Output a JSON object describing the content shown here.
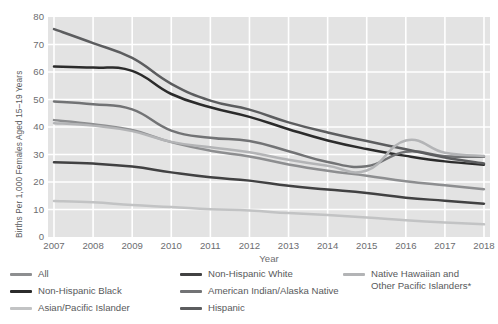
{
  "chart_data": {
    "type": "line",
    "title": "",
    "xlabel": "Year",
    "ylabel": "Births Per 1,000 Females Aged 15–19 Years",
    "x": [
      2007,
      2008,
      2009,
      2010,
      2011,
      2012,
      2013,
      2014,
      2015,
      2016,
      2017,
      2018
    ],
    "xticklabels": [
      "2007",
      "2008",
      "2009",
      "2010",
      "2011",
      "2012",
      "2013",
      "2014",
      "2015",
      "2016",
      "2017",
      "2018"
    ],
    "yticklabels": [
      "80",
      "70",
      "60",
      "50",
      "40",
      "30",
      "20",
      "10",
      "0"
    ],
    "yticks": [
      80,
      70,
      60,
      50,
      40,
      30,
      20,
      10,
      0
    ],
    "ylim": [
      0,
      80
    ],
    "grid": true,
    "legend_position": "bottom",
    "series": [
      {
        "name": "All",
        "color": "#8d8e90",
        "values": [
          42.5,
          41.0,
          38.9,
          34.5,
          31.4,
          29.3,
          26.4,
          24.1,
          22.3,
          20.3,
          18.8,
          17.4
        ]
      },
      {
        "name": "Non-Hispanic Black",
        "color": "#2b2b2b",
        "values": [
          62.0,
          61.6,
          60.4,
          52.0,
          47.2,
          43.7,
          39.2,
          35.1,
          32.0,
          29.5,
          27.5,
          26.3
        ]
      },
      {
        "name": "Asian/Pacific Islander",
        "color": "#c2c3c4",
        "values": [
          13.1,
          12.6,
          11.6,
          10.9,
          10.1,
          9.6,
          8.7,
          8.0,
          7.1,
          6.1,
          5.3,
          4.6
        ]
      },
      {
        "name": "Non-Hispanic White",
        "color": "#414142",
        "values": [
          27.2,
          26.7,
          25.6,
          23.5,
          21.7,
          20.5,
          18.6,
          17.3,
          16.0,
          14.3,
          13.2,
          12.1
        ]
      },
      {
        "name": "American Indian/Alaska Native",
        "color": "#727375",
        "values": [
          49.3,
          48.3,
          46.4,
          38.7,
          36.1,
          34.9,
          31.2,
          27.3,
          25.7,
          31.0,
          29.4,
          29.2
        ]
      },
      {
        "name": "Hispanic",
        "color": "#5c5d5f",
        "values": [
          75.6,
          70.5,
          65.1,
          55.7,
          49.6,
          46.3,
          41.7,
          38.0,
          34.9,
          31.9,
          28.9,
          26.7
        ]
      },
      {
        "name": "Native Hawaiian and\nOther Pacific Islanders*",
        "color": "#b3b4b6",
        "values": [
          41.4,
          40.5,
          38.5,
          34.6,
          32.6,
          30.8,
          28.1,
          25.9,
          24.2,
          35.1,
          30.6,
          29.5
        ]
      }
    ]
  },
  "legend": {
    "columns": [
      [
        {
          "label": "All",
          "color": "#8d8e90",
          "two_line": false
        },
        {
          "label": "Non-Hispanic Black",
          "color": "#2b2b2b",
          "two_line": false
        },
        {
          "label": "Asian/Pacific Islander",
          "color": "#c2c3c4",
          "two_line": false
        }
      ],
      [
        {
          "label": "Non-Hispanic White",
          "color": "#414142",
          "two_line": false
        },
        {
          "label": "American Indian/Alaska Native",
          "color": "#727375",
          "two_line": false
        },
        {
          "label": "Hispanic",
          "color": "#5c5d5f",
          "two_line": false
        }
      ],
      [
        {
          "label": "Native Hawaiian and\nOther Pacific Islanders*",
          "color": "#b3b4b6",
          "two_line": true
        }
      ]
    ]
  },
  "style": {
    "plot_background": "#e3e3e3",
    "gridline_color": "#ffffff",
    "page_background": "#ffffff",
    "text_color": "#58595b"
  }
}
